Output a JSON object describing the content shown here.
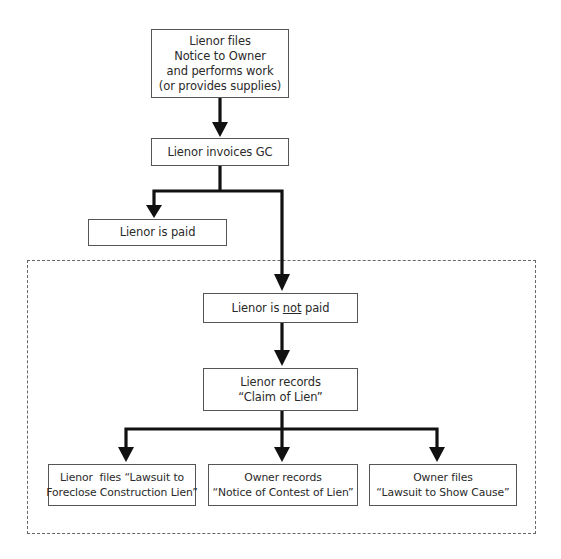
{
  "diagram": {
    "type": "flowchart",
    "nodes": [
      {
        "id": "notice",
        "lines": [
          "Lienor files",
          "Notice to Owner",
          "and performs work",
          "(or provides supplies)"
        ]
      },
      {
        "id": "invoice",
        "lines": [
          "Lienor invoices GC"
        ]
      },
      {
        "id": "paid",
        "lines": [
          "Lienor is paid"
        ]
      },
      {
        "id": "not_paid",
        "prefix": "Lienor is ",
        "underlined": "not",
        "suffix": " paid"
      },
      {
        "id": "claim",
        "lines": [
          "Lienor records",
          "“Claim of Lien”"
        ]
      },
      {
        "id": "foreclose",
        "lines": [
          "Lienor  files “Lawsuit to",
          "Foreclose Construction Lien”"
        ]
      },
      {
        "id": "contest",
        "lines": [
          "Owner records",
          "“Notice of Contest of Lien”"
        ]
      },
      {
        "id": "show_cause",
        "lines": [
          "Owner files",
          "“Lawsuit to Show Cause”"
        ]
      }
    ],
    "edges": [
      {
        "from": "notice",
        "to": "invoice"
      },
      {
        "from": "invoice",
        "to": "paid"
      },
      {
        "from": "invoice",
        "to": "not_paid"
      },
      {
        "from": "not_paid",
        "to": "claim"
      },
      {
        "from": "claim",
        "to": "foreclose"
      },
      {
        "from": "claim",
        "to": "contest"
      },
      {
        "from": "claim",
        "to": "show_cause"
      }
    ],
    "group": {
      "style": "dashed",
      "contains": [
        "not_paid",
        "claim",
        "foreclose",
        "contest",
        "show_cause"
      ]
    },
    "colors": {
      "line": "#111111",
      "box_border": "#555555",
      "dashed_border": "#666666",
      "text": "#2a2a2a"
    }
  }
}
